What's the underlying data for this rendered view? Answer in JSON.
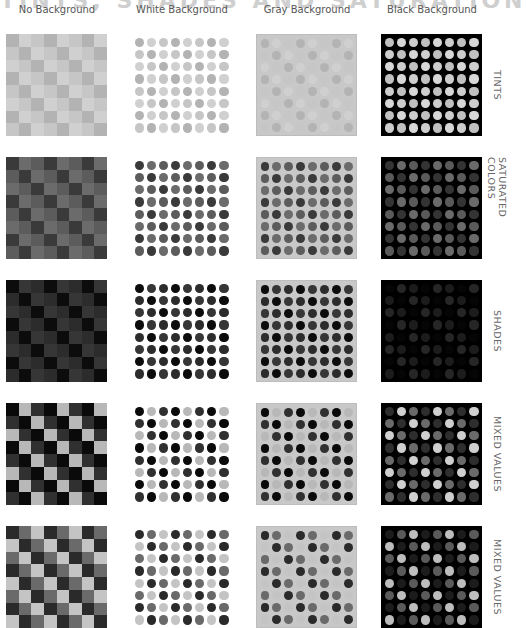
{
  "title": "TINTS, SHADES AND SATURATION",
  "columns": [
    {
      "label": "No Background",
      "bg": "none",
      "x": 6
    },
    {
      "label": "White Background",
      "bg": "white",
      "x": 131
    },
    {
      "label": "Gray Background",
      "bg": "gray",
      "x": 256
    },
    {
      "label": "Black Background",
      "bg": "black",
      "x": 381
    }
  ],
  "rows": [
    {
      "label": "TINTS",
      "y": 34,
      "colors": [
        "#b3b3b3",
        "#d0d0d0",
        "#c6c6c6"
      ],
      "black_colors": [
        "#c0c0c0",
        "#d7d7d7",
        "#cdcdcd"
      ],
      "pattern": "diag3"
    },
    {
      "label": "SATURATED COLORS",
      "y": 157,
      "colors": [
        "#3a3a3a",
        "#6b6b6b",
        "#5c5c5c"
      ],
      "black_colors": [
        "#343434",
        "#6a6a6a",
        "#5a5a5a"
      ],
      "pattern": "diag3"
    },
    {
      "label": "SHADES",
      "y": 280,
      "colors": [
        "#0c0c0c",
        "#363636",
        "#2c2c2c"
      ],
      "black_colors": [
        "#050505",
        "#262626",
        "#1c1c1c"
      ],
      "pattern": "diag3"
    },
    {
      "label": "MIXED VALUES",
      "y": 403,
      "colors": [
        "#0a0a0a",
        "#b8b8b8",
        "#303030"
      ],
      "black_colors": [
        "#2e2e2e",
        "#cfcfcf",
        "#6a6a6a"
      ],
      "pattern": "diag3"
    },
    {
      "label": "MIXED VALUES",
      "y": 526,
      "colors": [
        "#2a2a2a",
        "#c4c4c4",
        "#6a6a6a"
      ],
      "black_colors": [
        "#1c1c1c",
        "#bdbdbd",
        "#5a5a5a"
      ],
      "pattern": "diag3b"
    }
  ]
}
